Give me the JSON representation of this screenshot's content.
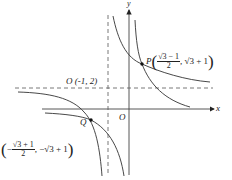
{
  "diagram": {
    "type": "coordinate-plane-hyperbolas",
    "axes": {
      "x_label": "x",
      "y_label": "y",
      "origin_label": "O"
    },
    "asymptotes": {
      "vertical": "x = -1",
      "horizontal": "y = 2",
      "center_label": "O (-1, 2)"
    },
    "points": {
      "P": {
        "name": "P",
        "x_num": "√3 − 1",
        "x_den": "2",
        "y": "√3 + 1"
      },
      "Q": {
        "name": "Q",
        "x_num": "√3 + 1",
        "x_den": "2",
        "x_sign": "−",
        "y": "−√3 + 1"
      }
    },
    "colors": {
      "stroke": "#333333",
      "background": "#ffffff"
    }
  }
}
